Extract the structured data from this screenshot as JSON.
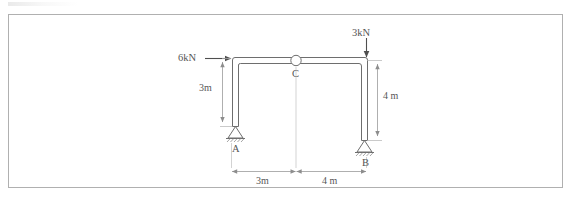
{
  "diagram": {
    "colors": {
      "member": "#6e6e6e",
      "dimension": "#9a9a9a",
      "text": "#565656",
      "border": "#b0b0b0"
    },
    "loads": [
      {
        "id": "load-6kn",
        "label": "6kN",
        "magnitude": 6,
        "unit": "kN",
        "direction": "horizontal-right",
        "applied_at": "top-of-column-A"
      },
      {
        "id": "load-3kn",
        "label": "3kN",
        "magnitude": 3,
        "unit": "kN",
        "direction": "vertical-down",
        "applied_at": "top-of-column-B"
      }
    ],
    "nodes": [
      {
        "id": "node-a",
        "label": "A",
        "type": "pin-support"
      },
      {
        "id": "node-b",
        "label": "B",
        "type": "pin-support"
      },
      {
        "id": "node-c",
        "label": "C",
        "type": "internal-hinge"
      }
    ],
    "dimensions": [
      {
        "id": "dim-left-height",
        "label": "3m",
        "value": 3,
        "unit": "m",
        "orientation": "vertical",
        "member": "column-A"
      },
      {
        "id": "dim-right-height",
        "label": "4 m",
        "value": 4,
        "unit": "m",
        "orientation": "vertical",
        "member": "column-B"
      },
      {
        "id": "dim-span-left",
        "label": "3m",
        "value": 3,
        "unit": "m",
        "orientation": "horizontal",
        "span": "A-to-C"
      },
      {
        "id": "dim-span-right",
        "label": "4 m",
        "value": 4,
        "unit": "m",
        "orientation": "horizontal",
        "span": "C-to-B"
      }
    ]
  }
}
